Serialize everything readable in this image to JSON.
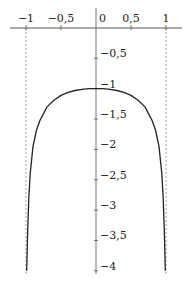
{
  "chart_data": {
    "type": "line",
    "title": "",
    "xlabel": "",
    "ylabel": "",
    "xlim": [
      -1.2,
      1.25
    ],
    "ylim": [
      -4.1,
      0.1
    ],
    "grid": false,
    "legend": null,
    "x_ticks": [
      {
        "value": -1,
        "label": "−1"
      },
      {
        "value": -0.5,
        "label": "−0,5"
      },
      {
        "value": 0,
        "label": "0"
      },
      {
        "value": 0.5,
        "label": "0,5"
      },
      {
        "value": 1,
        "label": "1"
      }
    ],
    "y_ticks": [
      {
        "value": -0.5,
        "label": "−0,5"
      },
      {
        "value": -1,
        "label": "−1"
      },
      {
        "value": -1.5,
        "label": "−1,5"
      },
      {
        "value": -2,
        "label": "−2"
      },
      {
        "value": -2.5,
        "label": "−2,5"
      },
      {
        "value": -3,
        "label": "−3"
      },
      {
        "value": -3.5,
        "label": "−3,5"
      },
      {
        "value": -4,
        "label": "−4"
      }
    ],
    "asymptotes": [
      {
        "x": -1,
        "style": "dashed"
      },
      {
        "x": 1,
        "style": "dashed"
      }
    ],
    "series": [
      {
        "name": "curve",
        "color": "#222222",
        "x": [
          -0.99,
          -0.98,
          -0.96,
          -0.94,
          -0.9,
          -0.85,
          -0.8,
          -0.7,
          -0.6,
          -0.5,
          -0.4,
          -0.3,
          -0.2,
          -0.1,
          0,
          0.1,
          0.2,
          0.3,
          0.4,
          0.5,
          0.6,
          0.7,
          0.8,
          0.85,
          0.9,
          0.94,
          0.96,
          0.98,
          0.99
        ],
        "y": [
          -4.0,
          -3.5,
          -2.8,
          -2.4,
          -1.95,
          -1.68,
          -1.52,
          -1.3,
          -1.19,
          -1.11,
          -1.06,
          -1.03,
          -1.01,
          -1.0,
          -1.0,
          -1.0,
          -1.01,
          -1.03,
          -1.06,
          -1.11,
          -1.19,
          -1.3,
          -1.52,
          -1.68,
          -1.95,
          -2.4,
          -2.8,
          -3.5,
          -4.0
        ]
      }
    ]
  }
}
